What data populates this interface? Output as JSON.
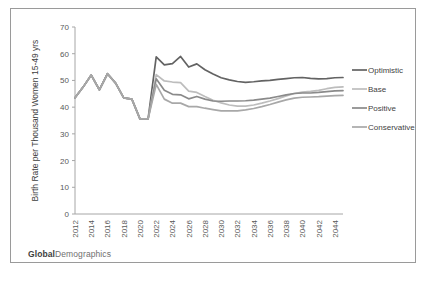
{
  "brand": {
    "bold": "Global",
    "rest": "Demographics"
  },
  "chart_data": {
    "type": "line",
    "title": "",
    "xlabel": "",
    "ylabel": "Birth Rate per Thousand Women 15-49 yrs",
    "ylim": [
      0,
      70
    ],
    "ytick_step": 10,
    "yticks": [
      0,
      10,
      20,
      30,
      40,
      50,
      60,
      70
    ],
    "xlim": [
      2012,
      2045
    ],
    "xticks": [
      2012,
      2014,
      2016,
      2018,
      2020,
      2022,
      2024,
      2026,
      2028,
      2030,
      2032,
      2034,
      2036,
      2038,
      2040,
      2042,
      2044
    ],
    "x": [
      2012,
      2013,
      2014,
      2015,
      2016,
      2017,
      2018,
      2019,
      2020,
      2021,
      2022,
      2023,
      2024,
      2025,
      2026,
      2027,
      2028,
      2029,
      2030,
      2031,
      2032,
      2033,
      2034,
      2035,
      2036,
      2037,
      2038,
      2039,
      2040,
      2041,
      2042,
      2043,
      2044,
      2045
    ],
    "grid": false,
    "legend_position": "right",
    "series": [
      {
        "name": "Optimistic",
        "color": "#636363",
        "width": 1.7,
        "values": [
          43.5,
          47.5,
          52.0,
          46.5,
          52.5,
          49.0,
          43.5,
          43.0,
          35.6,
          35.6,
          58.8,
          55.8,
          56.3,
          59.0,
          55.0,
          56.2,
          54.0,
          52.4,
          51.0,
          50.2,
          49.6,
          49.3,
          49.5,
          49.8,
          50.0,
          50.4,
          50.7,
          51.0,
          51.1,
          50.8,
          50.6,
          50.7,
          51.0,
          51.1
        ]
      },
      {
        "name": "Base",
        "color": "#bdbdbd",
        "width": 1.7,
        "values": [
          43.5,
          47.5,
          52.0,
          46.5,
          52.5,
          49.0,
          43.5,
          43.0,
          35.6,
          35.6,
          52.2,
          49.8,
          49.4,
          49.2,
          46.0,
          45.5,
          44.0,
          42.6,
          41.6,
          40.8,
          40.4,
          40.4,
          40.8,
          41.5,
          42.3,
          43.2,
          44.2,
          45.1,
          45.6,
          45.9,
          46.3,
          46.9,
          47.4,
          47.6
        ]
      },
      {
        "name": "Positive",
        "color": "#8a8a8a",
        "width": 1.7,
        "values": [
          43.5,
          47.5,
          52.0,
          46.5,
          52.5,
          49.0,
          43.5,
          43.0,
          35.6,
          35.6,
          50.6,
          46.3,
          44.8,
          44.6,
          43.1,
          44.0,
          43.0,
          42.3,
          42.2,
          42.3,
          42.3,
          42.4,
          42.6,
          43.0,
          43.4,
          44.0,
          44.6,
          45.1,
          45.3,
          45.3,
          45.5,
          45.8,
          46.1,
          46.2
        ]
      },
      {
        "name": "Conservative",
        "color": "#a8a8a8",
        "width": 1.7,
        "values": [
          43.5,
          47.5,
          52.0,
          46.5,
          52.5,
          49.0,
          43.5,
          43.0,
          35.6,
          35.6,
          48.5,
          43.0,
          41.5,
          41.5,
          40.2,
          40.2,
          39.6,
          39.1,
          38.6,
          38.6,
          38.6,
          39.0,
          39.5,
          40.2,
          41.0,
          41.9,
          42.7,
          43.4,
          43.7,
          43.8,
          43.9,
          44.1,
          44.3,
          44.4
        ]
      }
    ]
  }
}
